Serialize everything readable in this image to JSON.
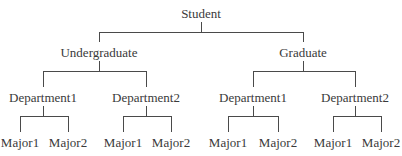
{
  "diagram": {
    "type": "hierarchy-tree",
    "colors": {
      "line": "#4a4a4a",
      "text": "#3a3a3a",
      "background": "#ffffff"
    },
    "root": {
      "label": "Student",
      "x": 201,
      "y": 18,
      "children": [
        {
          "label": "Undergraduate",
          "x": 99,
          "y": 57,
          "children": [
            {
              "label": "Department1",
              "x": 43,
              "y": 102,
              "children": [
                {
                  "label": "Major1",
                  "x": 20,
                  "y": 147
                },
                {
                  "label": "Major2",
                  "x": 68,
                  "y": 147
                }
              ]
            },
            {
              "label": "Department2",
              "x": 146,
              "y": 102,
              "children": [
                {
                  "label": "Major1",
                  "x": 123,
                  "y": 147
                },
                {
                  "label": "Major2",
                  "x": 171,
                  "y": 147
                }
              ]
            }
          ]
        },
        {
          "label": "Graduate",
          "x": 303,
          "y": 57,
          "children": [
            {
              "label": "Department1",
              "x": 253,
              "y": 102,
              "children": [
                {
                  "label": "Major1",
                  "x": 228,
                  "y": 147
                },
                {
                  "label": "Major2",
                  "x": 278,
                  "y": 147
                }
              ]
            },
            {
              "label": "Department2",
              "x": 355,
              "y": 102,
              "children": [
                {
                  "label": "Major1",
                  "x": 333,
                  "y": 147
                },
                {
                  "label": "Major2",
                  "x": 381,
                  "y": 147
                }
              ]
            }
          ]
        }
      ]
    },
    "connector": {
      "stem_top_gap": 8,
      "bar_offset": 14,
      "child_top_gap": 13
    }
  }
}
